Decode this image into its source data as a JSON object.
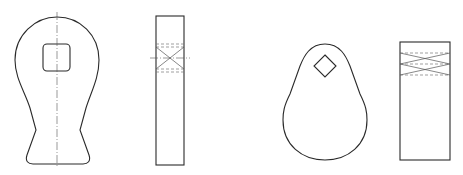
{
  "drawing": {
    "title": "Technical drawing: two pendant/handle parts with side views",
    "line_color": "#2a2a2a",
    "background": "#ffffff",
    "views": [
      {
        "id": "part-1-front",
        "description": "Bulb-shaped handle with square hole and vertical center line"
      },
      {
        "id": "part-1-side",
        "description": "Narrow rectangular side view with hidden lines and X cross"
      },
      {
        "id": "part-2-front",
        "description": "Teardrop/pear-shaped plate with diamond hole"
      },
      {
        "id": "part-2-side",
        "description": "Rectangular side view with double X hidden-line band"
      }
    ]
  }
}
